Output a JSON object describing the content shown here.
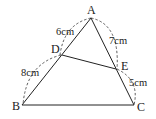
{
  "diagram": {
    "type": "geometry-triangle",
    "points": {
      "A": {
        "label": "A",
        "x": 91,
        "y": 18
      },
      "B": {
        "label": "B",
        "x": 22,
        "y": 105
      },
      "C": {
        "label": "C",
        "x": 134,
        "y": 105
      },
      "D": {
        "label": "D",
        "x": 62,
        "y": 55
      },
      "E": {
        "label": "E",
        "x": 116,
        "y": 69
      }
    },
    "segments": [
      {
        "from": "A",
        "to": "B"
      },
      {
        "from": "A",
        "to": "C"
      },
      {
        "from": "B",
        "to": "C"
      },
      {
        "from": "D",
        "to": "E"
      }
    ],
    "measurements": {
      "AD": "6cm",
      "AE": "7cm",
      "DB": "8cm",
      "EC": "5cm"
    },
    "colors": {
      "stroke": "#222222",
      "background": "#ffffff"
    }
  }
}
